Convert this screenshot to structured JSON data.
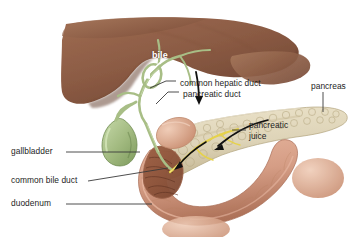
{
  "figure": {
    "background": "#ffffff"
  },
  "palette": {
    "liver": "#8a5a43",
    "liver_dark": "#6d4330",
    "gallbladder": "#9fb87e",
    "gallbladder_dark": "#7d9a5d",
    "duct_green": "#a8be86",
    "pancreas": "#ded4b8",
    "pancreas_shade": "#c5b893",
    "duodenum": "#d59d85",
    "duodenum_dark": "#b07a62",
    "duct_yellow": "#e6d24a",
    "arrow_black": "#111111",
    "arrow_white": "#ffffff",
    "leader": "#3a3a3a",
    "text": "#1d1d1d"
  },
  "labels": [
    {
      "id": "bile",
      "text": "bile",
      "style": "white",
      "x": 152,
      "y": 55
    },
    {
      "id": "common-hepatic-duct",
      "text": "common hepatic duct",
      "style": "dark",
      "x": 180,
      "y": 84
    },
    {
      "id": "pancreatic-duct",
      "text": "pancreatic duct",
      "style": "dark",
      "x": 183,
      "y": 95
    },
    {
      "id": "pancreas",
      "text": "pancreas",
      "style": "dark",
      "x": 311,
      "y": 87
    },
    {
      "id": "pancreatic-juice",
      "text": "pancreatic juice",
      "style": "two",
      "x": 249,
      "y": 126
    },
    {
      "id": "gallbladder",
      "text": "gallbladder",
      "style": "dark",
      "x": 11,
      "y": 148
    },
    {
      "id": "common-bile-duct",
      "text": "common bile duct",
      "style": "dark",
      "x": 11,
      "y": 177
    },
    {
      "id": "duodenum",
      "text": "duodenum",
      "style": "dark",
      "x": 11,
      "y": 200
    }
  ],
  "organs": [
    {
      "id": "liver",
      "name": "liver"
    },
    {
      "id": "gallbladder",
      "name": "gallbladder"
    },
    {
      "id": "pancreas",
      "name": "pancreas"
    },
    {
      "id": "duodenum",
      "name": "duodenum"
    },
    {
      "id": "bile-ducts",
      "name": "bile-duct-tree"
    },
    {
      "id": "pancreatic-duct-line",
      "name": "pancreatic-duct"
    }
  ]
}
